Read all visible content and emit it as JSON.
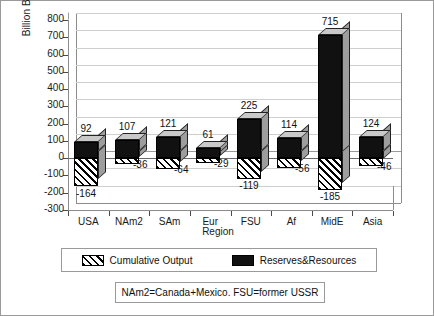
{
  "chart_data": {
    "type": "bar",
    "title": "",
    "xlabel": "Region",
    "ylabel": "Billion Barrels",
    "ylim": [
      -300,
      800
    ],
    "ytick_labels": [
      "800",
      "700",
      "600",
      "500",
      "400",
      "300",
      "200",
      "100",
      "0",
      "-100",
      "-200",
      "-300"
    ],
    "ytick_values": [
      800,
      700,
      600,
      500,
      400,
      300,
      200,
      100,
      0,
      -100,
      -200,
      -300
    ],
    "grid": true,
    "legend_position": "bottom",
    "categories": [
      "USA",
      "NAm2",
      "SAm",
      "Eur",
      "FSU",
      "Af",
      "MidE",
      "Asia"
    ],
    "series": [
      {
        "name": "Reserves&Resources",
        "style": "solid-black",
        "values": [
          92,
          107,
          121,
          61,
          225,
          114,
          715,
          124
        ],
        "labels": [
          "92",
          "107",
          "121",
          "61",
          "225",
          "114",
          "715",
          "124"
        ]
      },
      {
        "name": "Cumulative Output",
        "style": "diagonal-hatch",
        "values": [
          -164,
          -36,
          -64,
          -29,
          -119,
          -56,
          -185,
          -46
        ],
        "labels": [
          "-164",
          "-36",
          "-64",
          "-29",
          "-119",
          "-56",
          "-185",
          "-46"
        ]
      }
    ],
    "annotation": "NAm2=Canada+Mexico.  FSU=former USSR",
    "colors": {
      "bar_front": "#111111",
      "bar_side": "#9d9d9d",
      "bar_top": "#c9c9c9",
      "grid": "#b9b9b9",
      "axis": "#8c8c8c",
      "text": "#111111",
      "background": "#ffffff",
      "border": "#9a9a9a"
    }
  },
  "legend": {
    "items": [
      {
        "label": "Cumulative Output",
        "swatch": "hatched"
      },
      {
        "label": "Reserves&Resources",
        "swatch": "solid"
      }
    ]
  },
  "note": {
    "text": "NAm2=Canada+Mexico.  FSU=former USSR"
  }
}
